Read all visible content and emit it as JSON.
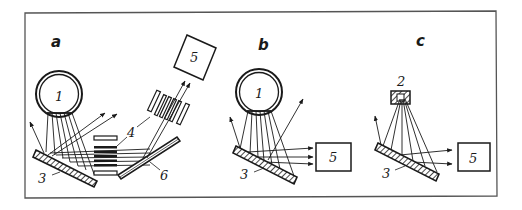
{
  "figure": {
    "frame_color": "#555555",
    "ink_color": "#1a1a1a",
    "panels": [
      {
        "id": "a",
        "label": "a",
        "components": {
          "source": "1",
          "crystal": "3",
          "collimator": "4",
          "detector": "5",
          "analyzer": "6"
        }
      },
      {
        "id": "b",
        "label": "b",
        "components": {
          "source": "1",
          "crystal": "3",
          "detector": "5"
        }
      },
      {
        "id": "c",
        "label": "c",
        "components": {
          "source": "2",
          "crystal": "3",
          "detector": "5"
        }
      }
    ]
  }
}
